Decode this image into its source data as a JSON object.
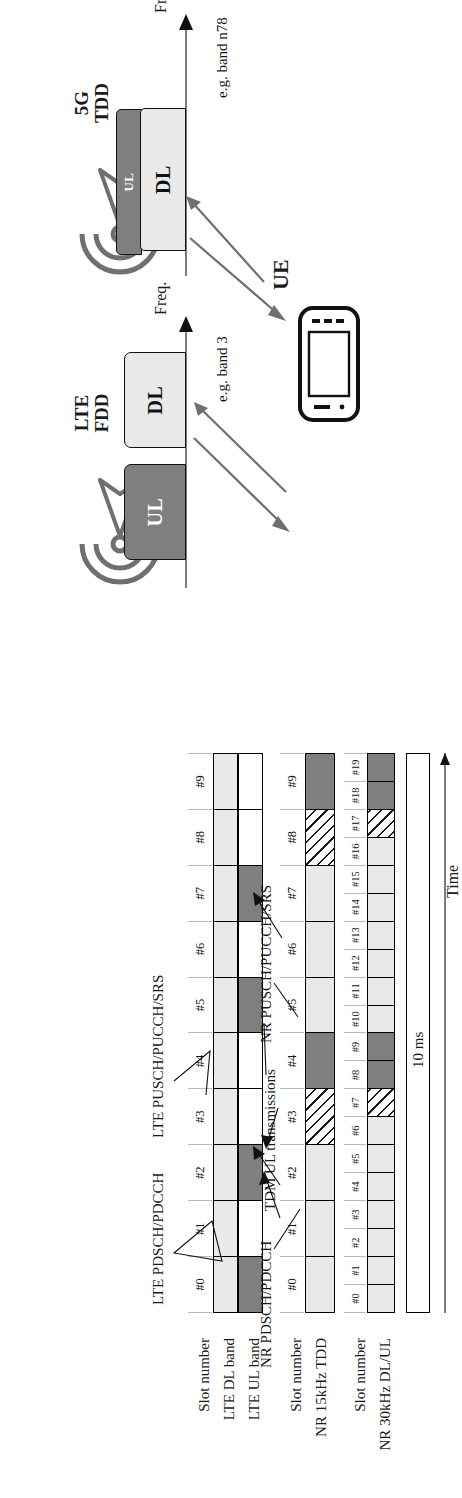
{
  "figure": {
    "time_axis_label": "Time",
    "frame_duration_label": "10 ms",
    "freq_axis_label": "Freq."
  },
  "colors": {
    "downlink_light": "#e9e9e9",
    "uplink_dark": "#7f7f7f",
    "special_hatched": "#ffffff",
    "empty": "#ffffff",
    "outline": "#000000",
    "antenna_gray": "#6f6f6f"
  },
  "legend": {
    "downlink": "DL",
    "uplink": "UL",
    "special_slot": "S"
  },
  "rows": [
    {
      "id": "lte",
      "number_label": "Slot number",
      "band_labels": [
        "LTE DL band",
        "LTE UL band"
      ],
      "slot_numbers": [
        "#0",
        "#1",
        "#2",
        "#3",
        "#4",
        "#5",
        "#6",
        "#7",
        "#8",
        "#9"
      ],
      "dl_pattern": [
        "D",
        "D",
        "D",
        "D",
        "D",
        "D",
        "D",
        "D",
        "D",
        "D"
      ],
      "ul_pattern": [
        "U",
        "-",
        "U",
        "-",
        "-",
        "U",
        "-",
        "U",
        "-",
        "-"
      ]
    },
    {
      "id": "nr15",
      "number_label": "Slot number",
      "band_labels": [
        "NR 15kHz TDD"
      ],
      "slot_numbers": [
        "#0",
        "#1",
        "#2",
        "#3",
        "#4",
        "#5",
        "#6",
        "#7",
        "#8",
        "#9"
      ],
      "pattern": [
        "D",
        "D",
        "D",
        "S",
        "U",
        "D",
        "D",
        "D",
        "S",
        "U"
      ]
    },
    {
      "id": "nr30",
      "number_label": "Slot number",
      "band_labels": [
        "NR 30kHz DL/UL"
      ],
      "slot_numbers": [
        "#0",
        "#1",
        "#2",
        "#3",
        "#4",
        "#5",
        "#6",
        "#7",
        "#8",
        "#9",
        "#10",
        "#11",
        "#12",
        "#13",
        "#14",
        "#15",
        "#16",
        "#17",
        "#18",
        "#19"
      ],
      "pattern": [
        "D",
        "D",
        "D",
        "D",
        "D",
        "D",
        "D",
        "S",
        "U",
        "U",
        "D",
        "D",
        "D",
        "D",
        "D",
        "D",
        "D",
        "S",
        "U",
        "U"
      ]
    }
  ],
  "annotations": {
    "lte_pdsch": "LTE PDSCH/PDCCH",
    "lte_pusch": "LTE PUSCH/PUCCH/SRS",
    "nr_pdsch": "NR PDSCH/PDCCH",
    "nr_pusch": "NR PUSCH/PUCCH/SRS",
    "tdm_ul": "TDM UL transmissions"
  },
  "systems": [
    {
      "id": "lte-fdd",
      "caption_line1": "LTE",
      "caption_line2": "FDD",
      "freq_label": "Freq.",
      "band_note": "e.g. band 3",
      "blocks": [
        {
          "label": "UL",
          "type": "uplink"
        },
        {
          "label": "DL",
          "type": "downlink"
        }
      ]
    },
    {
      "id": "nr-tdd",
      "caption_line1": "5G",
      "caption_line2": "TDD",
      "freq_label": "Freq.",
      "band_note": "e.g. band n78",
      "blocks": [
        {
          "label": "UL",
          "type": "uplink"
        },
        {
          "label": "DL",
          "type": "downlink"
        }
      ]
    }
  ],
  "ue": {
    "label": "UE"
  },
  "icons": {
    "base_station": "base-station-antenna-icon",
    "ue_device": "mobile-phone-icon",
    "time_arrow": "arrow-right-icon",
    "freq_arrow": "arrow-up-icon"
  }
}
